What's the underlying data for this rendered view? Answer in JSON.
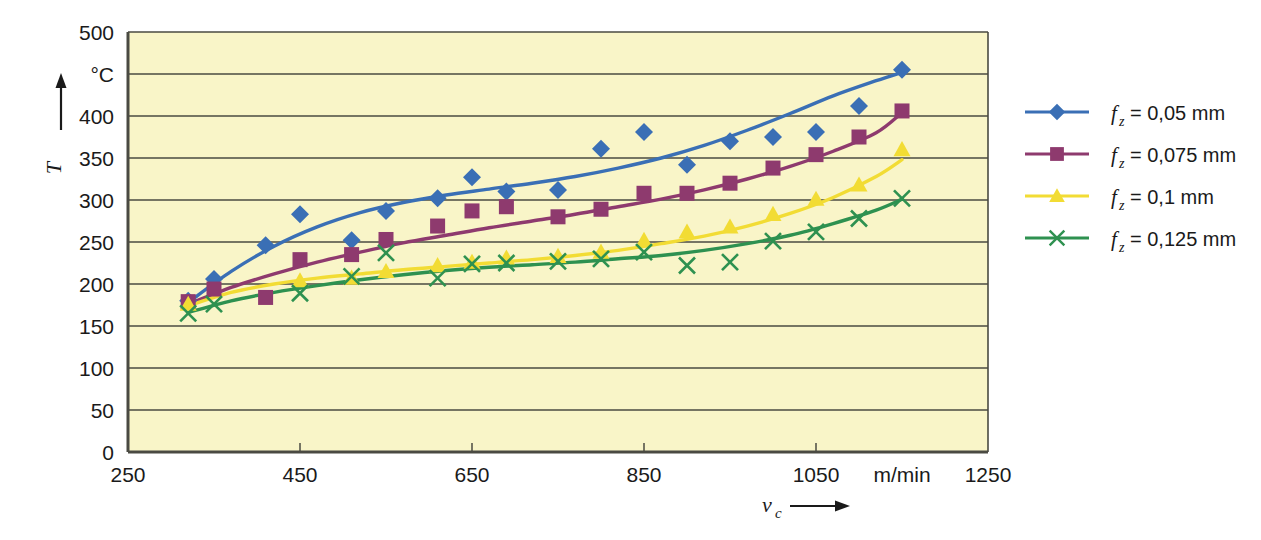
{
  "chart_data": {
    "type": "scatter",
    "title": "",
    "subtitle": "",
    "xlabel": "v_c",
    "ylabel": "T",
    "xlabel_symbol": "v",
    "xlabel_sub": "c",
    "ylabel_symbol": "T",
    "xunit": "m/min",
    "yunit": "°C",
    "xlim": [
      250,
      1250
    ],
    "ylim": [
      0,
      500
    ],
    "xticks": [
      250,
      450,
      650,
      850,
      1050,
      1250
    ],
    "xtick_labels": [
      "250",
      "450",
      "650",
      "850",
      "1050",
      "1250"
    ],
    "yticks": [
      0,
      50,
      100,
      150,
      200,
      250,
      300,
      350,
      400,
      450,
      500
    ],
    "ytick_labels": [
      "0",
      "50",
      "100",
      "150",
      "200",
      "250",
      "300",
      "350",
      "400",
      "°C",
      "500"
    ],
    "grid": "horizontal",
    "plot_background": "#f9f5c8",
    "legend_position": "right",
    "series": [
      {
        "name": "f_z = 0,05 mm",
        "label": "= 0,05 mm",
        "symbol": "f",
        "subscript": "z",
        "color": "#3a6fb5",
        "marker": "diamond",
        "points": [
          [
            320,
            180
          ],
          [
            350,
            206
          ],
          [
            410,
            246
          ],
          [
            450,
            283
          ],
          [
            510,
            252
          ],
          [
            550,
            287
          ],
          [
            610,
            302
          ],
          [
            650,
            327
          ],
          [
            690,
            310
          ],
          [
            750,
            312
          ],
          [
            800,
            361
          ],
          [
            850,
            381
          ],
          [
            900,
            342
          ],
          [
            950,
            370
          ],
          [
            1000,
            375
          ],
          [
            1050,
            381
          ],
          [
            1100,
            412
          ],
          [
            1150,
            455
          ]
        ],
        "fit": [
          [
            320,
            178
          ],
          [
            370,
            215
          ],
          [
            420,
            245
          ],
          [
            470,
            268
          ],
          [
            520,
            285
          ],
          [
            570,
            297
          ],
          [
            620,
            306
          ],
          [
            670,
            313
          ],
          [
            720,
            320
          ],
          [
            770,
            328
          ],
          [
            820,
            338
          ],
          [
            870,
            350
          ],
          [
            920,
            365
          ],
          [
            970,
            383
          ],
          [
            1020,
            403
          ],
          [
            1070,
            424
          ],
          [
            1120,
            442
          ],
          [
            1150,
            452
          ]
        ]
      },
      {
        "name": "f_z = 0,075 mm",
        "label": "= 0,075 mm",
        "symbol": "f",
        "subscript": "z",
        "color": "#8e3a6e",
        "marker": "square",
        "points": [
          [
            320,
            179
          ],
          [
            350,
            194
          ],
          [
            410,
            184
          ],
          [
            450,
            229
          ],
          [
            510,
            235
          ],
          [
            550,
            253
          ],
          [
            610,
            269
          ],
          [
            650,
            287
          ],
          [
            690,
            292
          ],
          [
            750,
            280
          ],
          [
            800,
            289
          ],
          [
            850,
            308
          ],
          [
            900,
            308
          ],
          [
            950,
            320
          ],
          [
            1000,
            338
          ],
          [
            1050,
            354
          ],
          [
            1100,
            375
          ],
          [
            1150,
            406
          ]
        ],
        "fit": [
          [
            320,
            176
          ],
          [
            370,
            196
          ],
          [
            420,
            212
          ],
          [
            470,
            226
          ],
          [
            520,
            238
          ],
          [
            570,
            249
          ],
          [
            620,
            258
          ],
          [
            670,
            267
          ],
          [
            720,
            275
          ],
          [
            770,
            283
          ],
          [
            820,
            292
          ],
          [
            870,
            301
          ],
          [
            920,
            312
          ],
          [
            970,
            325
          ],
          [
            1020,
            340
          ],
          [
            1070,
            358
          ],
          [
            1120,
            380
          ],
          [
            1150,
            404
          ]
        ]
      },
      {
        "name": "f_z = 0,1 mm",
        "label": "= 0,1 mm",
        "symbol": "f",
        "subscript": "z",
        "color": "#f2dc34",
        "marker": "triangle",
        "points": [
          [
            320,
            176
          ],
          [
            450,
            204
          ],
          [
            510,
            207
          ],
          [
            550,
            215
          ],
          [
            610,
            222
          ],
          [
            650,
            226
          ],
          [
            690,
            231
          ],
          [
            750,
            233
          ],
          [
            800,
            238
          ],
          [
            850,
            252
          ],
          [
            900,
            262
          ],
          [
            950,
            268
          ],
          [
            1000,
            283
          ],
          [
            1050,
            301
          ],
          [
            1100,
            318
          ],
          [
            1150,
            360
          ]
        ],
        "fit": [
          [
            320,
            174
          ],
          [
            370,
            190
          ],
          [
            420,
            200
          ],
          [
            470,
            207
          ],
          [
            520,
            212
          ],
          [
            570,
            217
          ],
          [
            620,
            221
          ],
          [
            670,
            225
          ],
          [
            720,
            229
          ],
          [
            770,
            234
          ],
          [
            820,
            240
          ],
          [
            870,
            248
          ],
          [
            920,
            257
          ],
          [
            970,
            269
          ],
          [
            1020,
            284
          ],
          [
            1070,
            303
          ],
          [
            1120,
            328
          ],
          [
            1150,
            348
          ]
        ]
      },
      {
        "name": "f_z = 0,125 mm",
        "label": "= 0,125 mm",
        "symbol": "f",
        "subscript": "z",
        "color": "#2e9150",
        "marker": "cross",
        "points": [
          [
            320,
            165
          ],
          [
            350,
            176
          ],
          [
            450,
            189
          ],
          [
            510,
            209
          ],
          [
            550,
            237
          ],
          [
            610,
            207
          ],
          [
            650,
            224
          ],
          [
            690,
            225
          ],
          [
            750,
            227
          ],
          [
            800,
            230
          ],
          [
            850,
            238
          ],
          [
            900,
            222
          ],
          [
            950,
            226
          ],
          [
            1000,
            251
          ],
          [
            1050,
            262
          ],
          [
            1100,
            278
          ],
          [
            1150,
            302
          ]
        ],
        "fit": [
          [
            320,
            166
          ],
          [
            370,
            180
          ],
          [
            420,
            190
          ],
          [
            470,
            198
          ],
          [
            520,
            205
          ],
          [
            570,
            211
          ],
          [
            620,
            216
          ],
          [
            670,
            220
          ],
          [
            720,
            223
          ],
          [
            770,
            226
          ],
          [
            820,
            230
          ],
          [
            870,
            234
          ],
          [
            920,
            240
          ],
          [
            970,
            248
          ],
          [
            1020,
            258
          ],
          [
            1070,
            272
          ],
          [
            1120,
            288
          ],
          [
            1150,
            301
          ]
        ]
      }
    ]
  },
  "legend": {
    "items": [
      {
        "label": "= 0,05 mm",
        "symbol": "f",
        "subscript": "z",
        "color": "#3a6fb5",
        "marker": "diamond"
      },
      {
        "label": "= 0,075 mm",
        "symbol": "f",
        "subscript": "z",
        "color": "#8e3a6e",
        "marker": "square"
      },
      {
        "label": "= 0,1 mm",
        "symbol": "f",
        "subscript": "z",
        "color": "#f2dc34",
        "marker": "triangle"
      },
      {
        "label": "= 0,125 mm",
        "symbol": "f",
        "subscript": "z",
        "color": "#2e9150",
        "marker": "cross"
      }
    ]
  },
  "axes": {
    "y_unit": "°C",
    "y_symbol": "T",
    "x_unit": "m/min",
    "x_symbol": "v",
    "x_subscript": "c",
    "x_tick_labels": [
      "250",
      "450",
      "650",
      "850",
      "1050",
      "1250"
    ],
    "y_tick_labels": [
      "500",
      "°C",
      "400",
      "350",
      "300",
      "250",
      "200",
      "150",
      "100",
      "50",
      "0"
    ]
  },
  "colors": {
    "plot_bg": "#f9f5c8",
    "grid": "#4a4a42",
    "frame": "#4a4a42",
    "series_1": "#3a6fb5",
    "series_2": "#8e3a6e",
    "series_3": "#f2dc34",
    "series_4": "#2e9150"
  }
}
